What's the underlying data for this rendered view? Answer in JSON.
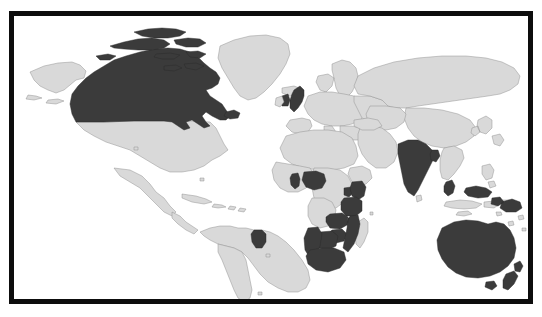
{
  "figure": {
    "kind": "world-choropleth-map",
    "title": "",
    "projection": "equirectangular",
    "frame": {
      "style": "thick-black-border",
      "border_color": "#0d0d0d",
      "inner_background": "#ffffff"
    },
    "legend_visible": false,
    "labels_visible": false
  },
  "colors": {
    "highlight": "#3b3b3b",
    "base_land": "#d9d9d9",
    "land_border": "#8a8a8a",
    "ocean": "#ffffff",
    "frame": "#0d0d0d",
    "page_background": "#ffffff"
  },
  "map_data": {
    "type": "choropleth",
    "categories": [
      "highlighted",
      "not-highlighted"
    ],
    "highlighted_count": 21,
    "highlighted": [
      "Canada",
      "United Kingdom",
      "Guyana",
      "Ghana",
      "Nigeria",
      "Kenya",
      "Uganda",
      "Tanzania",
      "Malawi",
      "Zambia",
      "Zimbabwe",
      "Mozambique",
      "Botswana",
      "Namibia",
      "South Africa",
      "India",
      "Bangladesh",
      "Malaysia",
      "Brunei",
      "Papua New Guinea",
      "Australia",
      "New Zealand"
    ],
    "not_highlighted_examples": [
      "United States",
      "Mexico",
      "Brazil",
      "Argentina",
      "Greenland",
      "Russia",
      "China",
      "France",
      "Germany",
      "Spain",
      "Egypt",
      "Saudi Arabia",
      "Indonesia",
      "Japan",
      "Madagascar"
    ]
  },
  "regions": {
    "north_america": "north-america-region",
    "south_america": "south-america-region",
    "europe": "europe-region",
    "africa": "africa-region",
    "asia": "asia-region",
    "oceania": "oceania-region"
  }
}
